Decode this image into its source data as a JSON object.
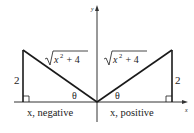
{
  "diagram": {
    "axes": {
      "x_label": "x",
      "y_label": "y"
    },
    "left_triangle": {
      "vertical_leg_label": "2",
      "hypotenuse_label_radicand": "x",
      "hypotenuse_label_exp": "2",
      "hypotenuse_label_rest": " + 4",
      "angle_label": "θ",
      "base_label": "x, negative"
    },
    "right_triangle": {
      "vertical_leg_label": "2",
      "hypotenuse_label_radicand": "x",
      "hypotenuse_label_exp": "2",
      "hypotenuse_label_rest": " + 4",
      "angle_label": "θ",
      "base_label": "x, positive"
    },
    "colors": {
      "line": "#1a1a1a",
      "axis": "#333333",
      "background": "#ffffff"
    }
  }
}
